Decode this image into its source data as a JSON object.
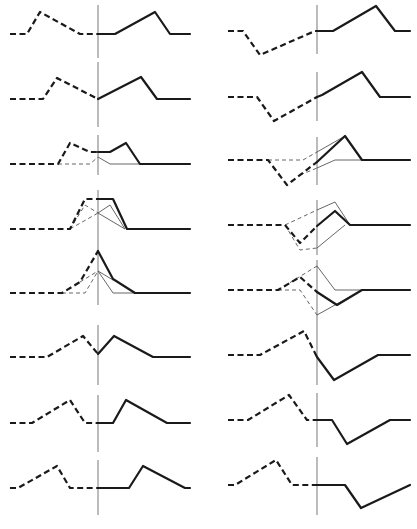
{
  "figure": {
    "width": 417,
    "height": 529,
    "colors": {
      "thick": "#1a1a1a",
      "thin": "#555555",
      "vline": "#6a6a6a",
      "background": "#ffffff"
    },
    "columns": [
      {
        "name": "left",
        "panels": [
          {
            "vline": [
              98,
              5,
              98,
              58
            ],
            "traces": [
              {
                "style": "thick-dashed",
                "points": "10,34 27,34 40,12 80,34 98,34"
              },
              {
                "style": "thick-solid",
                "points": "98,34 115,34 155,12 170,34 190,34"
              }
            ]
          },
          {
            "vline": [
              98,
              62,
              98,
              127
            ],
            "traces": [
              {
                "style": "thick-dashed",
                "points": "10,99 43,99 57,78 98,99"
              },
              {
                "style": "thick-solid",
                "points": "98,99 141,77 157,99 190,99"
              }
            ]
          },
          {
            "vline": [
              98,
              135,
              98,
              175
            ],
            "traces": [
              {
                "style": "thin-dashed",
                "points": "58,164 90,164 98,157"
              },
              {
                "style": "thin-solid",
                "points": "98,157 110,164 140,164"
              },
              {
                "style": "thick-dashed",
                "points": "10,164 58,164 70,143 90,152 98,152"
              },
              {
                "style": "thick-solid",
                "points": "98,152 110,152 126,143 140,164 190,164"
              }
            ]
          },
          {
            "vline": [
              98,
              190,
              98,
              240
            ],
            "traces": [
              {
                "style": "thin-dashed",
                "points": "70,229 85,205 98,213"
              },
              {
                "style": "thin-solid",
                "points": "98,213 125,229"
              },
              {
                "style": "thin-dashed",
                "points": "70,229 98,213"
              },
              {
                "style": "thin-solid",
                "points": "98,213 110,205 125,229"
              },
              {
                "style": "thick-dashed",
                "points": "10,229 70,229 85,199 98,199"
              },
              {
                "style": "thick-solid",
                "points": "98,199 113,199 127,229 190,229"
              }
            ]
          },
          {
            "vline": [
              98,
              240,
              98,
              305
            ],
            "traces": [
              {
                "style": "thin-dashed",
                "points": "62,293 85,293 98,271"
              },
              {
                "style": "thin-solid",
                "points": "98,271 113,293 135,293"
              },
              {
                "style": "thin-dashed",
                "points": "80,282 98,271"
              },
              {
                "style": "thin-solid",
                "points": "98,271 113,280"
              },
              {
                "style": "thick-dashed",
                "points": "10,293 62,293 80,282 98,251"
              },
              {
                "style": "thick-solid",
                "points": "98,251 113,279 135,293 190,293"
              }
            ]
          },
          {
            "vline": [
              98,
              325,
              98,
              385
            ],
            "traces": [
              {
                "style": "thick-dashed",
                "points": "10,357 47,357 83,336 98,354"
              },
              {
                "style": "thick-solid",
                "points": "98,354 114,336 153,357 190,357"
              }
            ]
          },
          {
            "vline": [
              98,
              395,
              98,
              452
            ],
            "traces": [
              {
                "style": "thick-dashed",
                "points": "10,423 32,423 70,400 85,423 98,423"
              },
              {
                "style": "thick-solid",
                "points": "98,423 113,423 126,400 167,423 190,423"
              }
            ]
          },
          {
            "vline": [
              98,
              460,
              98,
              515
            ],
            "traces": [
              {
                "style": "thick-dashed",
                "points": "10,488 18,488 57,466 70,488 98,488"
              },
              {
                "style": "thick-solid",
                "points": "98,488 129,488 143,466 185,488 190,488"
              }
            ]
          }
        ]
      },
      {
        "name": "right",
        "panels": [
          {
            "vline": [
              317,
              5,
              317,
              54
            ],
            "traces": [
              {
                "style": "thick-dashed",
                "points": "228,31 243,31 260,55 315,31 317,31"
              },
              {
                "style": "thick-solid",
                "points": "317,31 333,31 376,6 395,31 410,31"
              }
            ]
          },
          {
            "vline": [
              317,
              72,
              317,
              121
            ],
            "traces": [
              {
                "style": "thick-dashed",
                "points": "228,97 257,97 274,121 317,97"
              },
              {
                "style": "thick-solid",
                "points": "317,97 322,95 362,72 380,97 410,97"
              }
            ]
          },
          {
            "vline": [
              317,
              137,
              317,
              185
            ],
            "traces": [
              {
                "style": "thin-dashed",
                "points": "268,160 303,160 317,152"
              },
              {
                "style": "thin-solid",
                "points": "317,152 345,136"
              },
              {
                "style": "thin-dashed",
                "points": "300,175 317,168"
              },
              {
                "style": "thin-solid",
                "points": "317,168 335,160 362,160"
              },
              {
                "style": "thick-dashed",
                "points": "228,160 268,160 287,185 317,162"
              },
              {
                "style": "thick-solid",
                "points": "317,162 345,136 362,160 410,160"
              }
            ]
          },
          {
            "vline": [
              317,
              200,
              317,
              255
            ],
            "traces": [
              {
                "style": "thin-dashed",
                "points": "285,225 317,210"
              },
              {
                "style": "thin-solid",
                "points": "317,210 335,202 350,225"
              },
              {
                "style": "thin-dashed",
                "points": "285,225 300,250 317,248"
              },
              {
                "style": "thin-solid",
                "points": "317,248 345,225"
              },
              {
                "style": "thick-dashed",
                "points": "228,225 285,225 300,243 317,226"
              },
              {
                "style": "thick-solid",
                "points": "317,226 335,211 350,225 410,225"
              }
            ]
          },
          {
            "vline": [
              317,
              260,
              317,
              325
            ],
            "traces": [
              {
                "style": "thin-dashed",
                "points": "278,290 317,266"
              },
              {
                "style": "thin-solid",
                "points": "317,266 335,290 362,290"
              },
              {
                "style": "thin-dashed",
                "points": "278,290 300,290 317,315"
              },
              {
                "style": "thin-solid",
                "points": "317,315 362,290"
              },
              {
                "style": "thick-dashed",
                "points": "228,290 278,290 300,277 317,292"
              },
              {
                "style": "thick-solid",
                "points": "317,292 337,305 362,290 410,290"
              }
            ]
          },
          {
            "vline": [
              317,
              325,
              317,
              385
            ],
            "traces": [
              {
                "style": "thick-dashed",
                "points": "228,355 260,355 304,331 317,357"
              },
              {
                "style": "thick-solid",
                "points": "317,357 334,380 378,355 410,355"
              }
            ]
          },
          {
            "vline": [
              317,
              393,
              317,
              447
            ],
            "traces": [
              {
                "style": "thick-dashed",
                "points": "228,420 248,420 289,395 307,420 317,420"
              },
              {
                "style": "thick-solid",
                "points": "317,420 332,420 347,444 390,420 410,420"
              }
            ]
          },
          {
            "vline": [
              317,
              457,
              317,
              515
            ],
            "traces": [
              {
                "style": "thick-dashed",
                "points": "228,485 235,485 276,460 292,485 317,485"
              },
              {
                "style": "thick-solid",
                "points": "317,485 345,485 361,508 410,485"
              }
            ]
          }
        ]
      }
    ]
  }
}
